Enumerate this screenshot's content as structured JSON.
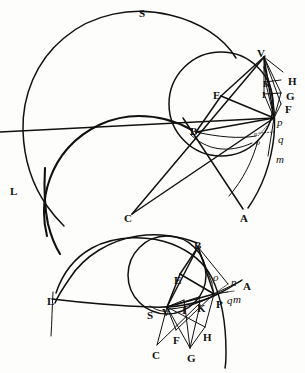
{
  "figure": {
    "background_color": "#fdfdfb",
    "ink_color": "#111111",
    "panels": [
      {
        "name": "upper-panel",
        "labels": [
          {
            "id": "S",
            "text": "S",
            "style": "cap",
            "x": 139,
            "y": 8
          },
          {
            "id": "V",
            "text": "V",
            "style": "cap",
            "x": 257,
            "y": 48
          },
          {
            "id": "H",
            "text": "H",
            "style": "cap",
            "x": 288,
            "y": 76
          },
          {
            "id": "G",
            "text": "G",
            "style": "cap",
            "x": 286,
            "y": 91
          },
          {
            "id": "F",
            "text": "F",
            "style": "cap",
            "x": 285,
            "y": 104
          },
          {
            "id": "K",
            "text": "K",
            "style": "capsm",
            "x": 263,
            "y": 80
          },
          {
            "id": "I",
            "text": "I",
            "style": "capsm",
            "x": 262,
            "y": 91
          },
          {
            "id": "E",
            "text": "E",
            "style": "cap",
            "x": 213,
            "y": 90
          },
          {
            "id": "B",
            "text": "B",
            "style": "cap",
            "x": 190,
            "y": 126
          },
          {
            "id": "p",
            "text": "p",
            "style": "ital",
            "x": 277,
            "y": 117
          },
          {
            "id": "q",
            "text": "q",
            "style": "ital",
            "x": 278,
            "y": 134
          },
          {
            "id": "n",
            "text": "n",
            "style": "italtiny",
            "x": 254,
            "y": 131
          },
          {
            "id": "o",
            "text": "o",
            "style": "italsm",
            "x": 256,
            "y": 139
          },
          {
            "id": "m",
            "text": "m",
            "style": "ital",
            "x": 276,
            "y": 154
          },
          {
            "id": "L",
            "text": "L",
            "style": "cap",
            "x": 10,
            "y": 186
          },
          {
            "id": "C",
            "text": "C",
            "style": "cap",
            "x": 124,
            "y": 213
          },
          {
            "id": "A",
            "text": "A",
            "style": "cap",
            "x": 240,
            "y": 213
          }
        ]
      },
      {
        "name": "lower-panel",
        "labels": [
          {
            "id": "B2",
            "text": "B",
            "style": "cap",
            "x": 194,
            "y": 240
          },
          {
            "id": "E2",
            "text": "E",
            "style": "cap",
            "x": 174,
            "y": 275
          },
          {
            "id": "o2",
            "text": "o",
            "style": "ital",
            "x": 213,
            "y": 272
          },
          {
            "id": "n2",
            "text": "n",
            "style": "ital",
            "x": 231,
            "y": 277
          },
          {
            "id": "A2",
            "text": "A",
            "style": "cap",
            "x": 243,
            "y": 281
          },
          {
            "id": "q2",
            "text": "q",
            "style": "ital",
            "x": 227,
            "y": 295
          },
          {
            "id": "m2",
            "text": "m",
            "style": "ital",
            "x": 233,
            "y": 294
          },
          {
            "id": "P",
            "text": "P",
            "style": "cap",
            "x": 216,
            "y": 299
          },
          {
            "id": "K2",
            "text": "K",
            "style": "cap",
            "x": 197,
            "y": 303
          },
          {
            "id": "I2",
            "text": "I",
            "style": "cap",
            "x": 182,
            "y": 305
          },
          {
            "id": "V2",
            "text": "V",
            "style": "cap",
            "x": 162,
            "y": 307
          },
          {
            "id": "S2",
            "text": "S",
            "style": "cap",
            "x": 147,
            "y": 310
          },
          {
            "id": "L2",
            "text": "L",
            "style": "cap",
            "x": 47,
            "y": 296
          },
          {
            "id": "F2",
            "text": "F",
            "style": "cap",
            "x": 173,
            "y": 335
          },
          {
            "id": "H2",
            "text": "H",
            "style": "cap",
            "x": 203,
            "y": 332
          },
          {
            "id": "C2",
            "text": "C",
            "style": "cap",
            "x": 152,
            "y": 350
          },
          {
            "id": "G2",
            "text": "G",
            "style": "cap",
            "x": 187,
            "y": 353
          }
        ]
      }
    ]
  }
}
